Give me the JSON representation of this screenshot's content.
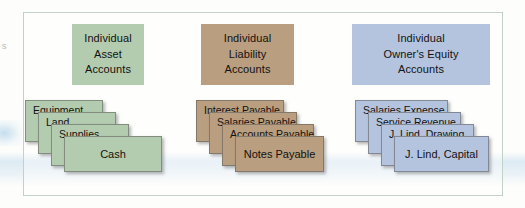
{
  "diagram": {
    "margin_mark": "s",
    "columns": [
      {
        "id": "asset",
        "color": "#b3ccb0",
        "header": {
          "lines": [
            "Individual",
            "Asset",
            "Accounts"
          ]
        },
        "cards": [
          "Equipment",
          "Land",
          "Supplies",
          "Cash"
        ]
      },
      {
        "id": "liability",
        "color": "#b99e7f",
        "header": {
          "lines": [
            "Individual",
            "Liability",
            "Accounts"
          ]
        },
        "cards": [
          "Interest Payable",
          "Salaries Payable",
          "Accounts Payable",
          "Notes Payable"
        ]
      },
      {
        "id": "owners-equity",
        "color": "#b4c4de",
        "header": {
          "lines": [
            "Individual",
            "Owner's Equity",
            "Accounts"
          ]
        },
        "cards": [
          "Salaries Expense",
          "Service Revenue",
          "J. Lind, Drawing",
          "J. Lind, Capital"
        ]
      }
    ]
  }
}
